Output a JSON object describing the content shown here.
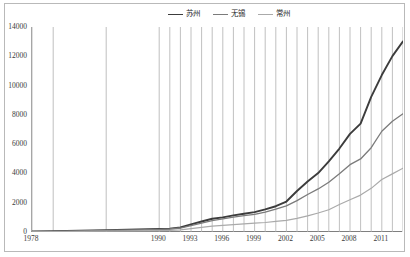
{
  "chart_data": {
    "type": "line",
    "title": "",
    "xlabel": "",
    "ylabel": "",
    "ylim": [
      0,
      14000
    ],
    "ytick_labels": [
      "0",
      "2000",
      "4000",
      "6000",
      "8000",
      "10000",
      "12000",
      "14000"
    ],
    "ytick_values": [
      0,
      2000,
      4000,
      6000,
      8000,
      10000,
      12000,
      14000
    ],
    "grid": "vertical",
    "legend_position": "top-center",
    "x": [
      1978,
      1980,
      1985,
      1990,
      1991,
      1992,
      1993,
      1994,
      1995,
      1996,
      1997,
      1998,
      1999,
      2000,
      2001,
      2002,
      2003,
      2004,
      2005,
      2006,
      2007,
      2008,
      2009,
      2010,
      2011,
      2012,
      2013
    ],
    "xtick_labels": [
      "1978",
      "1990",
      "1993",
      "1996",
      "1999",
      "2002",
      "2005",
      "2008",
      "2011"
    ],
    "xtick_positions": [
      1978,
      1990,
      1993,
      1996,
      1999,
      2002,
      2005,
      2008,
      2011
    ],
    "series": [
      {
        "name": "苏州",
        "color": "#3c3c3c",
        "width": 1.9,
        "values": [
          32,
          48,
          130,
          202,
          230,
          310,
          525,
          715,
          903,
          1002,
          1132,
          1250,
          1358,
          1540,
          1760,
          2080,
          2802,
          3450,
          4026,
          4820,
          5700,
          6700,
          7400,
          9229,
          10717,
          12012,
          13016
        ]
      },
      {
        "name": "无锡",
        "color": "#7b7b7b",
        "width": 1.3,
        "values": [
          24,
          38,
          108,
          180,
          205,
          272,
          440,
          610,
          780,
          890,
          1010,
          1120,
          1200,
          1360,
          1560,
          1780,
          2140,
          2560,
          2940,
          3400,
          3980,
          4600,
          4990,
          5758,
          6880,
          7568,
          8070
        ]
      },
      {
        "name": "常州",
        "color": "#aaaaaa",
        "width": 1.2,
        "values": [
          13,
          20,
          60,
          98,
          112,
          145,
          230,
          310,
          400,
          455,
          510,
          560,
          600,
          650,
          720,
          800,
          930,
          1100,
          1300,
          1520,
          1880,
          2200,
          2520,
          2980,
          3580,
          3970,
          4360
        ]
      }
    ]
  },
  "legend": {
    "items": [
      {
        "label": "苏州"
      },
      {
        "label": "无锡"
      },
      {
        "label": "常州"
      }
    ]
  }
}
